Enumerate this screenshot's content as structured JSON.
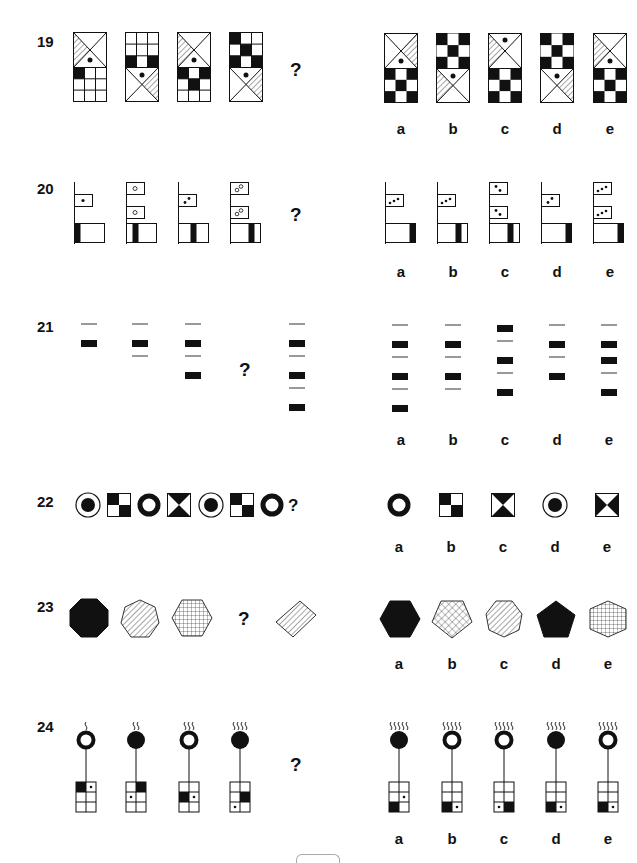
{
  "page": {
    "type": "non-verbal reasoning worksheet",
    "instruction_glyph": "?",
    "option_labels": [
      "a",
      "b",
      "c",
      "d",
      "e"
    ]
  },
  "questions": [
    {
      "number": "19",
      "sequence": [
        {
          "top": "triangle-box-hatched-left-dot",
          "bottom": "grid-3x3-one-black"
        },
        {
          "top": "grid-3x3-two-black",
          "bottom": "triangle-box-hatched-right-dot"
        },
        {
          "top": "triangle-box-hatched-left-dot",
          "bottom": "grid-3x3-three-black"
        },
        {
          "top": "grid-3x3-checker",
          "bottom": "triangle-box-hatched-right-dot"
        }
      ],
      "missing": "?",
      "options": [
        {
          "label": "a",
          "top": "triangle-box-hatched-right-dot",
          "bottom": "grid-3x3-checker"
        },
        {
          "label": "b",
          "top": "grid-3x3-checker",
          "bottom": "triangle-box-hatched-left-dot"
        },
        {
          "label": "c",
          "top": "triangle-box-hatched-left-dot-top",
          "bottom": "grid-3x3-checker"
        },
        {
          "label": "d",
          "top": "grid-3x3-checker",
          "bottom": "triangle-box-hatched-right-dot"
        },
        {
          "label": "e",
          "top": "triangle-box-hatched-left-dot",
          "bottom": "grid-3x3-checker"
        }
      ]
    },
    {
      "number": "20",
      "sequence": [
        {
          "flags": 1,
          "dots": "1 black",
          "bar": "left"
        },
        {
          "flags": 2,
          "dots": "1 white",
          "bar": "left-center"
        },
        {
          "flags": 1,
          "dots": "2 black",
          "bar": "center"
        },
        {
          "flags": 2,
          "dots": "2 white",
          "bar": "right-center"
        }
      ],
      "missing": "?",
      "options": [
        {
          "label": "a",
          "flags": 1,
          "dots": "3 black",
          "bar": "right"
        },
        {
          "label": "b",
          "flags": 1,
          "dots": "3 black",
          "bar": "right-center"
        },
        {
          "label": "c",
          "flags": 2,
          "dots": "2 black",
          "bar": "right-center"
        },
        {
          "label": "d",
          "flags": 1,
          "dots": "2 black",
          "bar": "right"
        },
        {
          "label": "e",
          "flags": 2,
          "dots": "3 black",
          "bar": "right"
        }
      ]
    },
    {
      "number": "21",
      "sequence": [
        "line,block",
        "line,block,line",
        "line,block,line,block",
        "?",
        "line,block,line,block,line,block"
      ],
      "missing": "?",
      "options": [
        {
          "label": "a",
          "items": "line,block,line,block,line,block"
        },
        {
          "label": "b",
          "items": "line,block,line,block,line"
        },
        {
          "label": "c",
          "items": "block,line,block,line,block"
        },
        {
          "label": "d",
          "items": "line,block,line,block"
        },
        {
          "label": "e",
          "items": "line,block,block,line,block"
        }
      ]
    },
    {
      "number": "22",
      "sequence": [
        "target",
        "quad-square",
        "thick-ring",
        "hourglass",
        "target",
        "quad-square",
        "thick-ring"
      ],
      "missing": "?",
      "options": [
        {
          "label": "a",
          "shape": "thick-ring"
        },
        {
          "label": "b",
          "shape": "quad-square"
        },
        {
          "label": "c",
          "shape": "hourglass"
        },
        {
          "label": "d",
          "shape": "target"
        },
        {
          "label": "e",
          "shape": "bowtie"
        }
      ]
    },
    {
      "number": "23",
      "sequence": [
        "octagon-black",
        "heptagon-hatched",
        "hexagon-grid",
        "?",
        "square-hatched-rotated"
      ],
      "missing": "?",
      "options": [
        {
          "label": "a",
          "shape": "hexagon-black"
        },
        {
          "label": "b",
          "shape": "pentagon-crosshatch"
        },
        {
          "label": "c",
          "shape": "heptagon-hatched"
        },
        {
          "label": "d",
          "shape": "pentagon-black"
        },
        {
          "label": "e",
          "shape": "hexagon-grid"
        }
      ]
    },
    {
      "number": "24",
      "sequence": [
        {
          "waves": 1,
          "head": "ring",
          "black": [
            0,
            0
          ],
          "dot": [
            0,
            1
          ]
        },
        {
          "waves": 2,
          "head": "solid",
          "black": [
            0,
            1
          ],
          "dot": [
            1,
            0
          ]
        },
        {
          "waves": 3,
          "head": "ring",
          "black": [
            1,
            0
          ],
          "dot": [
            1,
            1
          ]
        },
        {
          "waves": 4,
          "head": "solid",
          "black": [
            1,
            1
          ],
          "dot": [
            2,
            0
          ]
        }
      ],
      "missing": "?",
      "options": [
        {
          "label": "a",
          "waves": 5,
          "head": "solid",
          "black": [
            2,
            0
          ],
          "dot": [
            1,
            1
          ]
        },
        {
          "label": "b",
          "waves": 5,
          "head": "ring",
          "black": [
            2,
            0
          ],
          "dot": [
            2,
            1
          ]
        },
        {
          "label": "c",
          "waves": 5,
          "head": "ring",
          "black": [
            2,
            1
          ],
          "dot": [
            2,
            0
          ]
        },
        {
          "label": "d",
          "waves": 5,
          "head": "solid",
          "black": [
            2,
            0
          ],
          "dot": [
            2,
            1
          ]
        },
        {
          "label": "e",
          "waves": 5,
          "head": "ring",
          "black": [
            2,
            0
          ],
          "dot": [
            2,
            1
          ]
        }
      ]
    }
  ]
}
